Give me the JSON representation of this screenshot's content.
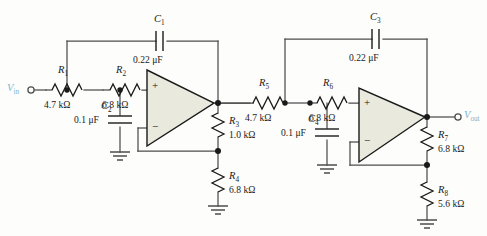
{
  "figure": {
    "kind": "schematic",
    "ports": {
      "input": {
        "name": "V",
        "sub": "in",
        "color": "#7ab5d3"
      },
      "output": {
        "name": "V",
        "sub": "out",
        "color": "#7ab5d3"
      }
    },
    "opamp_signs": {
      "plus": "+",
      "minus": "−"
    },
    "components": [
      {
        "id": "R1",
        "ref": "R",
        "sub": "1",
        "value": "4.7 kΩ",
        "type": "resistor",
        "orientation": "horizontal"
      },
      {
        "id": "R2",
        "ref": "R",
        "sub": "2",
        "value": "6.8 kΩ",
        "type": "resistor",
        "orientation": "horizontal"
      },
      {
        "id": "R3",
        "ref": "R",
        "sub": "3",
        "value": "1.0 kΩ",
        "type": "resistor",
        "orientation": "vertical"
      },
      {
        "id": "R4",
        "ref": "R",
        "sub": "4",
        "value": "6.8 kΩ",
        "type": "resistor",
        "orientation": "vertical"
      },
      {
        "id": "R5",
        "ref": "R",
        "sub": "5",
        "value": "4.7 kΩ",
        "type": "resistor",
        "orientation": "horizontal"
      },
      {
        "id": "R6",
        "ref": "R",
        "sub": "6",
        "value": "6.8 kΩ",
        "type": "resistor",
        "orientation": "horizontal"
      },
      {
        "id": "R7",
        "ref": "R",
        "sub": "7",
        "value": "6.8 kΩ",
        "type": "resistor",
        "orientation": "vertical"
      },
      {
        "id": "R8",
        "ref": "R",
        "sub": "8",
        "value": "5.6 kΩ",
        "type": "resistor",
        "orientation": "vertical"
      },
      {
        "id": "C1",
        "ref": "C",
        "sub": "1",
        "value": "0.22 μF",
        "type": "capacitor",
        "orientation": "horizontal"
      },
      {
        "id": "C2",
        "ref": "C",
        "sub": "2",
        "value": "0.1 μF",
        "type": "capacitor",
        "orientation": "vertical"
      },
      {
        "id": "C3",
        "ref": "C",
        "sub": "3",
        "value": "0.22 μF",
        "type": "capacitor",
        "orientation": "horizontal"
      },
      {
        "id": "C4",
        "ref": "C",
        "sub": "4",
        "value": "0.1 μF",
        "type": "capacitor",
        "orientation": "vertical"
      }
    ],
    "opamps": [
      {
        "id": "U1",
        "stage": "first"
      },
      {
        "id": "U2",
        "stage": "second"
      }
    ],
    "grounds": 4,
    "colors": {
      "wire": "#4d4d4d",
      "opamp_fill": "#e9e9dd",
      "opamp_stroke": "#1a1a1a",
      "text": "#1a1a1a",
      "port_label": "#7ab5d3",
      "background": "#fdfdfb"
    }
  }
}
